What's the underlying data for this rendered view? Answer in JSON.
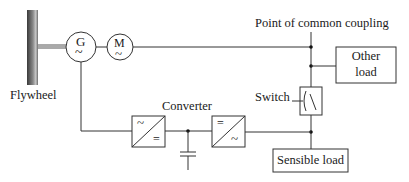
{
  "diagram": {
    "type": "electrical-schematic",
    "labels": {
      "flywheel": "Flywheel",
      "generator": "G",
      "generator_symbol": "~",
      "motor": "M",
      "motor_symbol": "~",
      "pcc": "Point of common coupling",
      "other_load_line1": "Other",
      "other_load_line2": "load",
      "switch": "Switch",
      "converter": "Converter",
      "sensible_load": "Sensible load",
      "conv1_top": "~",
      "conv1_bottom": "=",
      "conv2_top": "=",
      "conv2_bottom": "~"
    },
    "colors": {
      "line": "#333333",
      "flywheel_dark": "#3a3a3a",
      "flywheel_light": "#b5b5b5"
    }
  }
}
